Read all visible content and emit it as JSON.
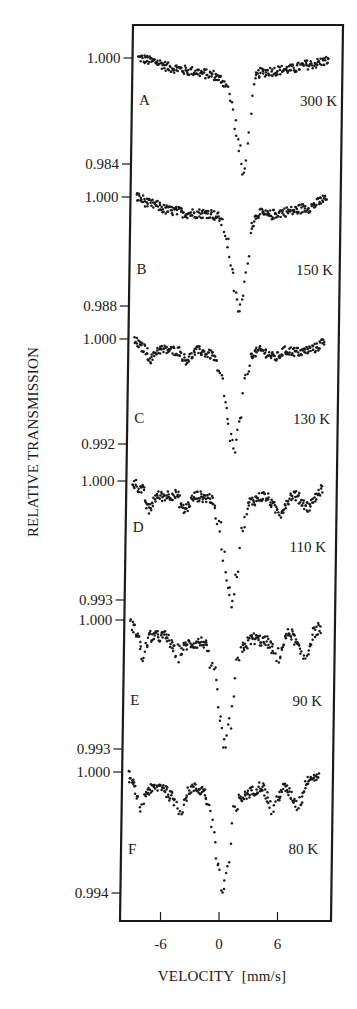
{
  "chart_data": {
    "type": "scatter",
    "title": "",
    "xlabel": "VELOCITY  [mm/s]",
    "ylabel": "RELATIVE TRANSMISSION",
    "xlim": [
      -10,
      11.5
    ],
    "x_ticks": [
      -6,
      0,
      6
    ],
    "x_tick_labels": [
      "-6",
      "0",
      "6"
    ],
    "grid": false,
    "legend": null,
    "layout": "vertically stacked panels sharing one velocity axis",
    "series": [
      {
        "panel": "A",
        "temperature": "300 K",
        "y_ticks": [
          1.0,
          0.984
        ],
        "y_tick_labels": [
          "1.000",
          "0.984"
        ],
        "baseline": 1.0,
        "minimum": 0.982,
        "minimum_velocity": 1.4,
        "shape": "single asymmetric absorption line with sloping baseline",
        "x": [
          -9.5,
          -8,
          -6,
          -4,
          -2,
          -1,
          -0.5,
          0,
          0.5,
          1.0,
          1.4,
          1.8,
          2.2,
          2.6,
          3,
          4,
          6,
          8,
          10
        ],
        "y": [
          1.0,
          0.9995,
          0.9985,
          0.998,
          0.9975,
          0.9968,
          0.996,
          0.994,
          0.99,
          0.986,
          0.982,
          0.986,
          0.9935,
          0.9972,
          0.9978,
          0.998,
          0.9983,
          0.999,
          0.9996
        ]
      },
      {
        "panel": "B",
        "temperature": "150 K",
        "y_ticks": [
          1.0,
          0.988
        ],
        "y_tick_labels": [
          "1.000",
          "0.988"
        ],
        "baseline": 1.0,
        "minimum": 0.9875,
        "minimum_velocity": 1.2,
        "shape": "single absorption line, slight baseline undulation",
        "x": [
          -9.5,
          -8,
          -6,
          -4,
          -2,
          -1,
          -0.5,
          0,
          0.5,
          1.0,
          1.2,
          1.6,
          2.0,
          2.4,
          3,
          4,
          6,
          8,
          10
        ],
        "y": [
          1.0,
          0.9992,
          0.9985,
          0.9982,
          0.9982,
          0.9978,
          0.9965,
          0.9948,
          0.991,
          0.988,
          0.9875,
          0.989,
          0.9935,
          0.997,
          0.9982,
          0.998,
          0.9984,
          0.9988,
          0.9998
        ]
      },
      {
        "panel": "C",
        "temperature": "130 K",
        "y_ticks": [
          1.0,
          0.992
        ],
        "y_tick_labels": [
          "1.000",
          "0.992"
        ],
        "baseline": 1.0,
        "minimum": 0.9915,
        "minimum_velocity": 0.9,
        "shape": "central line with emerging weak magnetic sextet",
        "x": [
          -9.5,
          -8.5,
          -7.8,
          -7,
          -5,
          -4.2,
          -3,
          -1.5,
          -0.5,
          0,
          0.5,
          0.9,
          1.4,
          2.0,
          2.6,
          3.5,
          5,
          6,
          7.5,
          9,
          10
        ],
        "y": [
          0.9998,
          0.9993,
          0.9985,
          0.9992,
          0.9991,
          0.9984,
          0.9991,
          0.9988,
          0.997,
          0.9945,
          0.9925,
          0.9915,
          0.9935,
          0.997,
          0.9989,
          0.9991,
          0.9986,
          0.9991,
          0.999,
          0.9993,
          0.9998
        ]
      },
      {
        "panel": "D",
        "temperature": "110 K",
        "y_ticks": [
          1.0,
          0.993
        ],
        "y_tick_labels": [
          "1.000",
          "0.993"
        ],
        "baseline": 1.0,
        "minimum": 0.993,
        "minimum_velocity": 0.8,
        "shape": "central line plus developing sextet",
        "x": [
          -9.5,
          -8.5,
          -7.8,
          -7,
          -5,
          -4.2,
          -3,
          -1.5,
          -0.5,
          0,
          0.4,
          0.8,
          1.3,
          1.9,
          2.6,
          4,
          5.6,
          7,
          8.6,
          9.5,
          10
        ],
        "y": [
          0.9999,
          0.9995,
          0.9983,
          0.9991,
          0.9992,
          0.9983,
          0.9991,
          0.999,
          0.9975,
          0.9955,
          0.994,
          0.993,
          0.9945,
          0.9975,
          0.9988,
          0.9991,
          0.9982,
          0.9992,
          0.9985,
          0.9992,
          0.9996
        ]
      },
      {
        "panel": "E",
        "temperature": "90 K",
        "y_ticks": [
          1.0,
          0.993
        ],
        "y_tick_labels": [
          "1.000",
          "0.993"
        ],
        "baseline": 1.0,
        "minimum": 0.993,
        "minimum_velocity": 0.4,
        "shape": "central line plus resolved magnetic sextet",
        "x": [
          -9.5,
          -8.8,
          -8.2,
          -7.5,
          -6,
          -4.6,
          -3.5,
          -2,
          -0.8,
          -0.2,
          0.4,
          0.9,
          1.5,
          2.2,
          3,
          4.5,
          5.6,
          6.8,
          8.4,
          9.5,
          10
        ],
        "y": [
          0.9998,
          0.9993,
          0.998,
          0.9991,
          0.9991,
          0.9982,
          0.9987,
          0.9988,
          0.997,
          0.9945,
          0.993,
          0.9945,
          0.9975,
          0.9986,
          0.999,
          0.9988,
          0.998,
          0.9993,
          0.998,
          0.9994,
          0.9996
        ]
      },
      {
        "panel": "F",
        "temperature": "80 K",
        "y_ticks": [
          1.0,
          0.994
        ],
        "y_tick_labels": [
          "1.000",
          "0.994"
        ],
        "baseline": 1.0,
        "minimum": 0.994,
        "minimum_velocity": 0.3,
        "shape": "fully developed magnetic sextet plus central line",
        "x": [
          -9.5,
          -8.9,
          -8.3,
          -7.5,
          -6,
          -5.1,
          -4.2,
          -3,
          -1.8,
          -0.8,
          -0.2,
          0.3,
          0.8,
          1.4,
          2.1,
          3,
          4.2,
          5.3,
          6.5,
          8,
          9,
          10
        ],
        "y": [
          0.9998,
          0.9993,
          0.9982,
          0.9991,
          0.9993,
          0.9988,
          0.9982,
          0.9992,
          0.9991,
          0.9975,
          0.9955,
          0.994,
          0.9952,
          0.998,
          0.9987,
          0.999,
          0.9993,
          0.9982,
          0.9992,
          0.9984,
          0.9997,
          0.9998
        ]
      }
    ]
  },
  "figure": {
    "ink_color": "#1a1a1a",
    "background": "#ffffff"
  }
}
